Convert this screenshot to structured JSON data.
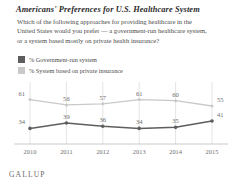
{
  "title": "Americans' Preferences for U.S. Healthcare System",
  "subtitle_lines": [
    "Which of the following approaches for providing healthcare in the",
    "United States would you prefer — a government-run healthcare system,",
    "or a system based mostly on private health insurance?"
  ],
  "footer": {
    "brand": "GALLUP"
  },
  "colors": {
    "government_line": "#5e5e5e",
    "private_line": "#c9c9c9",
    "gridline": "#d8d8d8",
    "axis": "#bdbdbd",
    "label_text": "#6e6e6e",
    "title_text": "#2b2b2b",
    "body_text": "#4a4a4a"
  },
  "legend": {
    "position": "top-left",
    "items": [
      {
        "label": "% Government-run system",
        "swatch": "#5e5e5e"
      },
      {
        "label": "% System based on private insurance",
        "swatch": "#c9c9c9"
      }
    ]
  },
  "chart_data": {
    "type": "line",
    "title": "Americans' Preferences for U.S. Healthcare System",
    "subtitle": "Which of the following approaches for providing healthcare in the United States would you prefer — a government-run healthcare system, or a system based mostly on private health insurance?",
    "xlabel": "",
    "ylabel": "",
    "categories": [
      "2010",
      "2011",
      "2012",
      "2013",
      "2014",
      "2015"
    ],
    "x": [
      2010,
      2011,
      2012,
      2013,
      2014,
      2015
    ],
    "ylim": [
      0,
      70
    ],
    "grid": "vertical",
    "series": [
      {
        "name": "% System based on private insurance",
        "color": "#c9c9c9",
        "values": [
          61,
          56,
          57,
          61,
          60,
          55
        ]
      },
      {
        "name": "% Government-run system",
        "color": "#5e5e5e",
        "values": [
          34,
          39,
          36,
          34,
          35,
          41
        ]
      }
    ]
  },
  "axis": {
    "tick_labels": [
      "2010",
      "2011",
      "2012",
      "2013",
      "2014",
      "2015"
    ]
  }
}
